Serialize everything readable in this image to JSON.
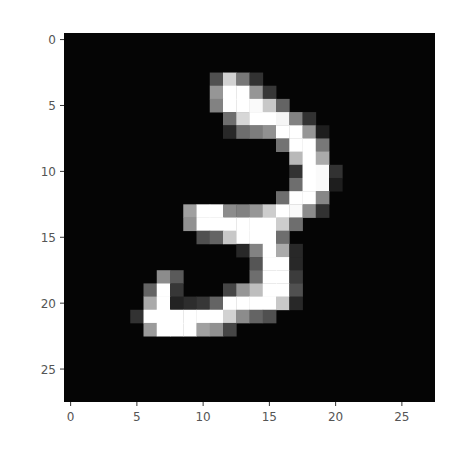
{
  "chart_data": {
    "type": "heatmap",
    "title": "",
    "xlabel": "",
    "ylabel": "",
    "colormap": "gray",
    "grid": false,
    "rows": 28,
    "cols": 28,
    "xlim": [
      -0.5,
      27.5
    ],
    "ylim": [
      27.5,
      -0.5
    ],
    "x_ticks": [
      0,
      5,
      10,
      15,
      20,
      25
    ],
    "y_ticks": [
      0,
      5,
      10,
      15,
      20,
      25
    ],
    "x_tick_labels": [
      "0",
      "5",
      "10",
      "15",
      "20",
      "25"
    ],
    "y_tick_labels": [
      "0",
      "5",
      "10",
      "15",
      "20",
      "25"
    ],
    "nonzero_pixels": {
      "3": {
        "11": 80,
        "12": 210,
        "13": 120,
        "14": 50
      },
      "4": {
        "11": 150,
        "12": 255,
        "13": 255,
        "14": 150,
        "15": 55
      },
      "5": {
        "11": 130,
        "12": 255,
        "13": 255,
        "14": 250,
        "15": 200,
        "16": 100
      },
      "6": {
        "12": 110,
        "13": 215,
        "14": 255,
        "15": 255,
        "16": 245,
        "17": 130,
        "18": 50
      },
      "7": {
        "12": 40,
        "13": 110,
        "14": 125,
        "15": 145,
        "16": 255,
        "17": 255,
        "18": 150,
        "19": 30
      },
      "8": {
        "16": 115,
        "17": 255,
        "18": 255,
        "19": 120
      },
      "9": {
        "17": 185,
        "18": 255,
        "19": 170
      },
      "10": {
        "17": 50,
        "18": 255,
        "19": 250,
        "20": 50
      },
      "11": {
        "17": 110,
        "18": 255,
        "19": 250,
        "20": 30
      },
      "12": {
        "16": 110,
        "17": 255,
        "18": 255,
        "19": 135
      },
      "13": {
        "9": 160,
        "10": 255,
        "11": 255,
        "12": 140,
        "13": 130,
        "14": 150,
        "15": 205,
        "16": 255,
        "17": 250,
        "18": 140,
        "19": 50
      },
      "14": {
        "9": 145,
        "10": 255,
        "11": 255,
        "12": 255,
        "13": 255,
        "14": 255,
        "15": 255,
        "16": 205,
        "17": 110
      },
      "15": {
        "10": 80,
        "11": 100,
        "12": 200,
        "13": 255,
        "14": 255,
        "15": 255,
        "16": 110
      },
      "16": {
        "13": 40,
        "14": 130,
        "15": 255,
        "16": 170,
        "17": 40
      },
      "17": {
        "14": 85,
        "15": 255,
        "16": 255,
        "17": 40
      },
      "18": {
        "7": 140,
        "8": 90,
        "14": 110,
        "15": 255,
        "16": 255,
        "17": 60
      },
      "19": {
        "6": 100,
        "7": 255,
        "8": 55,
        "12": 70,
        "13": 150,
        "14": 190,
        "15": 255,
        "16": 255,
        "17": 80
      },
      "20": {
        "6": 170,
        "7": 255,
        "8": 35,
        "9": 45,
        "10": 55,
        "11": 100,
        "12": 255,
        "13": 255,
        "14": 255,
        "15": 255,
        "16": 200,
        "17": 40
      },
      "21": {
        "5": 50,
        "6": 255,
        "7": 255,
        "8": 255,
        "9": 255,
        "10": 255,
        "11": 255,
        "12": 210,
        "13": 140,
        "14": 100,
        "15": 80
      },
      "22": {
        "6": 155,
        "7": 255,
        "8": 255,
        "9": 255,
        "10": 160,
        "11": 145,
        "12": 70
      }
    }
  },
  "colors": {
    "background": "#ffffff",
    "image_background": "#050505",
    "tick_label": "#555555",
    "tick_line": "#333333"
  }
}
